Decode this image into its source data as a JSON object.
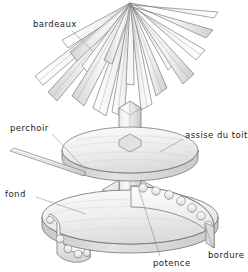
{
  "illustration": {
    "title": "Exploded assembly diagram of a bird feeder roof and base",
    "background_color": "#ffffff",
    "line_color": "#5a5a5a",
    "fill_light": "#f4f4f4",
    "fill_mid": "#e4e4e4",
    "fill_shade": "#cfcfcf",
    "label_color": "#1c1c1c"
  },
  "labels": [
    {
      "id": "bardeaux",
      "text": "bardeaux",
      "part": "roof-shingles",
      "x": 33,
      "y": 19,
      "leader": {
        "from_x": 72,
        "from_y": 31,
        "to_x": 93,
        "to_y": 51
      }
    },
    {
      "id": "perchoir",
      "text": "perchoir",
      "part": "perch-rod",
      "x": 10,
      "y": 123,
      "leader": {
        "from_x": 52,
        "from_y": 134,
        "to_x": 86,
        "to_y": 170
      }
    },
    {
      "id": "assise_du_toit",
      "text": "assise du toit",
      "part": "roof-seat-disk",
      "x": 185,
      "y": 130,
      "leader": {
        "from_x": 183,
        "from_y": 139,
        "to_x": 160,
        "to_y": 152
      }
    },
    {
      "id": "fond",
      "text": "fond",
      "part": "base-disk",
      "x": 5,
      "y": 189,
      "leader": {
        "from_x": 36,
        "from_y": 197,
        "to_x": 86,
        "to_y": 214
      }
    },
    {
      "id": "potence",
      "text": "potence",
      "part": "bracket",
      "x": 153,
      "y": 258,
      "leader": {
        "from_x": 160,
        "from_y": 256,
        "to_x": 139,
        "to_y": 190
      }
    },
    {
      "id": "bordure",
      "text": "bordure",
      "part": "scalloped-edging-band",
      "x": 208,
      "y": 250,
      "leader": {
        "from_x": 213,
        "from_y": 248,
        "to_x": 206,
        "to_y": 228
      }
    }
  ],
  "parts": [
    {
      "id": "roof-shingles",
      "name": "bardeaux",
      "count_visible": 17,
      "description": "radiating tapered shingle slats forming a conical roof"
    },
    {
      "id": "roof-seat-disk",
      "name": "assise du toit",
      "description": "upper circular disk supporting the roof"
    },
    {
      "id": "base-disk",
      "name": "fond",
      "description": "lower circular base disk"
    },
    {
      "id": "center-post",
      "name": "poteau central",
      "description": "vertical square column joining the disks"
    },
    {
      "id": "bracket",
      "name": "potence",
      "description": "triangular bracket between post and upper disk"
    },
    {
      "id": "edging-band",
      "name": "bordure",
      "description": "scalloped decorative band around the base"
    },
    {
      "id": "edging-band-loose",
      "name": "bordure (pièce détachée)",
      "description": "detached scalloped band segment at lower left"
    },
    {
      "id": "perch-rod",
      "name": "perchoir",
      "description": "thin diagonal dowel perch"
    }
  ]
}
